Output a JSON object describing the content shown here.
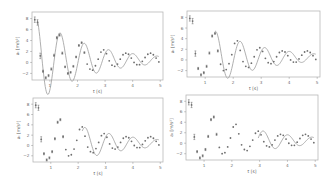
{
  "chart_data": [
    {
      "type": "scatter",
      "panel": "top-left",
      "title": "",
      "xlabel": "t [s]",
      "ylabel": "a_t [m/s^2]",
      "xlim": [
        0.35,
        5.1
      ],
      "ylim": [
        -3.2,
        9.2
      ],
      "xticks": [
        1,
        2,
        3,
        4,
        5
      ],
      "yticks": [
        -2,
        0,
        2,
        4,
        6,
        8
      ],
      "grid": false,
      "fit_start": 0.55,
      "series": [
        {
          "name": "measured",
          "kind": "points_with_errorbars"
        },
        {
          "name": "fit",
          "kind": "damped_cosine_line"
        }
      ]
    },
    {
      "type": "scatter",
      "panel": "top-right",
      "title": "",
      "xlabel": "t [s]",
      "ylabel": "a_t [m/s^2]",
      "xlim": [
        0.35,
        5.1
      ],
      "ylim": [
        -3.2,
        9.2
      ],
      "xticks": [
        1,
        2,
        3,
        4,
        5
      ],
      "yticks": [
        -2,
        0,
        2,
        4,
        6,
        8
      ],
      "grid": false,
      "fit_start": 1.35,
      "series": [
        {
          "name": "measured",
          "kind": "points_with_errorbars"
        },
        {
          "name": "fit",
          "kind": "damped_cosine_line"
        }
      ]
    },
    {
      "type": "scatter",
      "panel": "bottom-left",
      "title": "",
      "xlabel": "t [s]",
      "ylabel": "a_t [m/s^2]",
      "xlim": [
        0.35,
        5.1
      ],
      "ylim": [
        -3.2,
        9.2
      ],
      "xticks": [
        1,
        2,
        3,
        4,
        5
      ],
      "yticks": [
        -2,
        0,
        2,
        4,
        6,
        8
      ],
      "grid": false,
      "fit_start": 2.15,
      "series": [
        {
          "name": "measured",
          "kind": "points_with_errorbars"
        },
        {
          "name": "fit",
          "kind": "damped_cosine_line"
        }
      ]
    },
    {
      "type": "scatter",
      "panel": "bottom-right",
      "title": "",
      "xlabel": "t [s]",
      "ylabel": "a_t [m/s^2]",
      "xlim": [
        0.35,
        5.1
      ],
      "ylim": [
        -3.2,
        9.2
      ],
      "xticks": [
        1,
        2,
        3,
        4,
        5
      ],
      "yticks": [
        -2,
        0,
        2,
        4,
        6,
        8
      ],
      "grid": false,
      "fit_start": 2.95,
      "series": [
        {
          "name": "measured",
          "kind": "points_with_errorbars"
        },
        {
          "name": "fit",
          "kind": "damped_cosine_line"
        }
      ]
    }
  ],
  "measured_points": {
    "t": [
      0.45,
      0.55,
      0.65,
      0.75,
      0.85,
      0.95,
      1.05,
      1.15,
      1.25,
      1.35,
      1.45,
      1.55,
      1.65,
      1.75,
      1.85,
      1.95,
      2.05,
      2.15,
      2.25,
      2.35,
      2.45,
      2.55,
      2.65,
      2.75,
      2.85,
      2.95,
      3.05,
      3.15,
      3.25,
      3.35,
      3.45,
      3.55,
      3.65,
      3.75,
      3.85,
      3.95,
      4.05,
      4.15,
      4.25,
      4.35,
      4.45,
      4.55,
      4.65,
      4.75,
      4.85,
      4.95
    ],
    "a": [
      7.8,
      7.3,
      1.2,
      -1.6,
      -2.8,
      -2.4,
      -1.2,
      1.3,
      4.5,
      5.0,
      1.7,
      -0.8,
      -2.0,
      -1.8,
      -0.7,
      1.0,
      3.1,
      3.6,
      1.8,
      -0.3,
      -1.2,
      -1.4,
      -0.6,
      0.6,
      1.9,
      2.3,
      1.6,
      0.3,
      -0.5,
      -0.7,
      -0.3,
      0.6,
      1.4,
      1.7,
      1.5,
      0.8,
      0.0,
      -0.4,
      -0.4,
      0.2,
      0.9,
      1.5,
      1.7,
      1.4,
      0.8,
      0.1
    ],
    "err": [
      0.5,
      0.5,
      0.5,
      0.2,
      0.2,
      0.2,
      0.2,
      0.2,
      0.2,
      0.2,
      0.2,
      0.15,
      0.15,
      0.15,
      0.15,
      0.15,
      0.15,
      0.15,
      0.15,
      0.12,
      0.12,
      0.12,
      0.12,
      0.12,
      0.12,
      0.12,
      0.12,
      0.12,
      0.1,
      0.1,
      0.1,
      0.1,
      0.1,
      0.1,
      0.1,
      0.1,
      0.1,
      0.1,
      0.1,
      0.1,
      0.1,
      0.1,
      0.1,
      0.1,
      0.1,
      0.1
    ]
  },
  "fit_model": {
    "form": "A*exp(-g*t)*cos(w*t+p)+c",
    "A": 10.5,
    "g": 0.55,
    "w": 7.15,
    "p": -3.55,
    "c": 0.45
  },
  "panels_layout": [
    {
      "x0": 32,
      "y0": 12,
      "x1": 163,
      "y1": 80
    },
    {
      "x0": 187,
      "y0": 11,
      "x1": 320,
      "y1": 77
    },
    {
      "x0": 33,
      "y0": 98,
      "x1": 163,
      "y1": 162
    },
    {
      "x0": 186,
      "y0": 95,
      "x1": 318,
      "y1": 160
    }
  ]
}
